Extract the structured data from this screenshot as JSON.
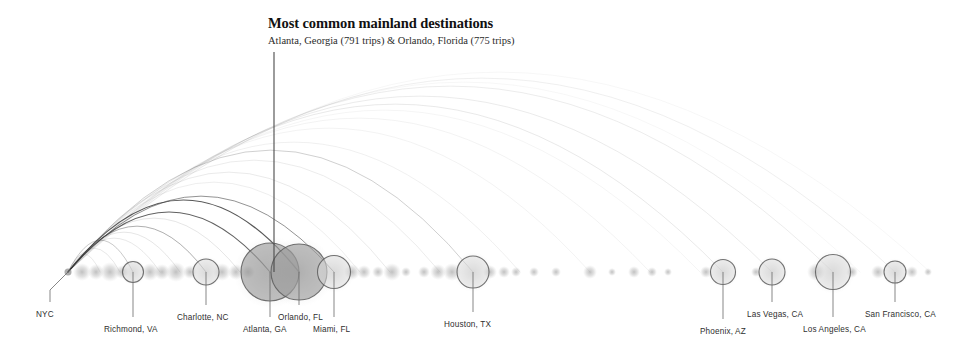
{
  "figure": {
    "title": "Most common mainland destinations",
    "subtitle": "Atlanta, Georgia (791 trips) & Orlando, Florida (775 trips)",
    "background_color": "#ffffff",
    "node_stroke_color": "#5a5a5a",
    "node_fill_color": "#9a9a9a",
    "arc_color": "#3a3a3a",
    "leader_color": "#6b6b6b",
    "label_color": "#2f2f2f"
  },
  "chart_data": {
    "type": "arc-flow-map",
    "title": "Most common mainland destinations",
    "subtitle": "Atlanta, Georgia (791 trips) & Orlando, Florida (775 trips)",
    "xlabel": "",
    "ylabel": "",
    "origin": "NYC",
    "value_unit": "trips",
    "baseline_y": 272,
    "legend": "",
    "grid": false,
    "annotations": [
      {
        "text": "Most common mainland destinations",
        "subtext": "Atlanta, Georgia (791 trips) & Orlando, Florida (775 trips)",
        "points_to": "Orlando, FL",
        "leader_x": 274,
        "leader_y_top": 52,
        "leader_y_bottom": 272
      }
    ],
    "labeled_nodes": [
      {
        "name": "NYC",
        "x": 68,
        "r": 3.5,
        "trips": null,
        "label_x": 36,
        "label_y": 310,
        "leader": "diagonal"
      },
      {
        "name": "Richmond, VA",
        "x": 133,
        "r": 10.5,
        "trips": null,
        "label_x": 104,
        "label_y": 325,
        "leader": "vertical"
      },
      {
        "name": "Charlotte, NC",
        "x": 206,
        "r": 13.0,
        "trips": null,
        "label_x": 177,
        "label_y": 313,
        "leader": "vertical"
      },
      {
        "name": "Atlanta, GA",
        "x": 270,
        "r": 29.0,
        "trips": 791,
        "label_x": 243,
        "label_y": 325,
        "leader": "vertical"
      },
      {
        "name": "Orlando, FL",
        "x": 299,
        "r": 28.0,
        "trips": 775,
        "label_x": 278,
        "label_y": 313,
        "leader": "vertical"
      },
      {
        "name": "Miami, FL",
        "x": 334,
        "r": 16.5,
        "trips": null,
        "label_x": 313,
        "label_y": 325,
        "leader": "vertical"
      },
      {
        "name": "Houston, TX",
        "x": 473,
        "r": 16.0,
        "trips": null,
        "label_x": 444,
        "label_y": 320,
        "leader": "vertical"
      },
      {
        "name": "Phoenix, AZ",
        "x": 723,
        "r": 12.5,
        "trips": null,
        "label_x": 700,
        "label_y": 327,
        "leader": "vertical"
      },
      {
        "name": "Las Vegas, CA",
        "x": 772,
        "r": 13.0,
        "trips": null,
        "label_x": 747,
        "label_y": 310,
        "leader": "vertical"
      },
      {
        "name": "Los Angeles, CA",
        "x": 833,
        "r": 17.5,
        "trips": null,
        "label_x": 803,
        "label_y": 325,
        "leader": "vertical"
      },
      {
        "name": "San Francisco, CA",
        "x": 895,
        "r": 11.0,
        "trips": null,
        "label_x": 865,
        "label_y": 310,
        "leader": "vertical"
      }
    ],
    "unlabeled_blobs": [
      {
        "x": 82,
        "r": 9
      },
      {
        "x": 96,
        "r": 8
      },
      {
        "x": 110,
        "r": 10
      },
      {
        "x": 122,
        "r": 7
      },
      {
        "x": 150,
        "r": 9
      },
      {
        "x": 162,
        "r": 8
      },
      {
        "x": 176,
        "r": 10
      },
      {
        "x": 190,
        "r": 7
      },
      {
        "x": 222,
        "r": 9
      },
      {
        "x": 236,
        "r": 8
      },
      {
        "x": 248,
        "r": 7
      },
      {
        "x": 352,
        "r": 8
      },
      {
        "x": 364,
        "r": 7
      },
      {
        "x": 378,
        "r": 6
      },
      {
        "x": 392,
        "r": 9
      },
      {
        "x": 406,
        "r": 5
      },
      {
        "x": 424,
        "r": 6
      },
      {
        "x": 438,
        "r": 8
      },
      {
        "x": 452,
        "r": 9
      },
      {
        "x": 490,
        "r": 7
      },
      {
        "x": 504,
        "r": 6
      },
      {
        "x": 516,
        "r": 5
      },
      {
        "x": 534,
        "r": 5
      },
      {
        "x": 556,
        "r": 5
      },
      {
        "x": 590,
        "r": 7
      },
      {
        "x": 612,
        "r": 4
      },
      {
        "x": 634,
        "r": 6
      },
      {
        "x": 652,
        "r": 5
      },
      {
        "x": 668,
        "r": 4
      },
      {
        "x": 706,
        "r": 6
      },
      {
        "x": 756,
        "r": 5
      },
      {
        "x": 816,
        "r": 9
      },
      {
        "x": 852,
        "r": 6
      },
      {
        "x": 878,
        "r": 7
      },
      {
        "x": 912,
        "r": 6
      },
      {
        "x": 928,
        "r": 4
      }
    ],
    "arcs": [
      {
        "to_x": 299,
        "peak_y": 200,
        "opacity": 0.85,
        "width": 1.2
      },
      {
        "to_x": 270,
        "peak_y": 212,
        "opacity": 0.8,
        "width": 1.1
      },
      {
        "to_x": 334,
        "peak_y": 196,
        "opacity": 0.55,
        "width": 1.0
      },
      {
        "to_x": 206,
        "peak_y": 226,
        "opacity": 0.45,
        "width": 0.9
      },
      {
        "to_x": 473,
        "peak_y": 150,
        "opacity": 0.3,
        "width": 0.8
      },
      {
        "to_x": 133,
        "peak_y": 240,
        "opacity": 0.35,
        "width": 0.8
      },
      {
        "to_x": 723,
        "peak_y": 104,
        "opacity": 0.16,
        "width": 0.7
      },
      {
        "to_x": 772,
        "peak_y": 96,
        "opacity": 0.15,
        "width": 0.7
      },
      {
        "to_x": 833,
        "peak_y": 86,
        "opacity": 0.14,
        "width": 0.7
      },
      {
        "to_x": 895,
        "peak_y": 78,
        "opacity": 0.12,
        "width": 0.7
      },
      {
        "to_x": 390,
        "peak_y": 172,
        "opacity": 0.18,
        "width": 0.6
      },
      {
        "to_x": 440,
        "peak_y": 160,
        "opacity": 0.16,
        "width": 0.6
      },
      {
        "to_x": 520,
        "peak_y": 142,
        "opacity": 0.13,
        "width": 0.6
      },
      {
        "to_x": 590,
        "peak_y": 128,
        "opacity": 0.11,
        "width": 0.6
      },
      {
        "to_x": 650,
        "peak_y": 118,
        "opacity": 0.1,
        "width": 0.6
      },
      {
        "to_x": 240,
        "peak_y": 218,
        "opacity": 0.22,
        "width": 0.6
      },
      {
        "to_x": 180,
        "peak_y": 232,
        "opacity": 0.22,
        "width": 0.6
      },
      {
        "to_x": 160,
        "peak_y": 238,
        "opacity": 0.2,
        "width": 0.6
      },
      {
        "to_x": 120,
        "peak_y": 248,
        "opacity": 0.2,
        "width": 0.6
      },
      {
        "to_x": 100,
        "peak_y": 254,
        "opacity": 0.18,
        "width": 0.6
      },
      {
        "to_x": 360,
        "peak_y": 182,
        "opacity": 0.15,
        "width": 0.6
      },
      {
        "to_x": 700,
        "peak_y": 110,
        "opacity": 0.09,
        "width": 0.6
      },
      {
        "to_x": 860,
        "peak_y": 82,
        "opacity": 0.08,
        "width": 0.6
      },
      {
        "to_x": 930,
        "peak_y": 72,
        "opacity": 0.07,
        "width": 0.6
      }
    ]
  }
}
